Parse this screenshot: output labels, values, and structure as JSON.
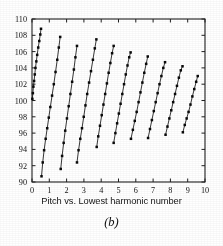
{
  "figure": {
    "caption": "Pitch vs. Lowest harmonic number",
    "subcaption": "(b)"
  },
  "colors": {
    "axis": "#262626",
    "line": "#1a1a1a",
    "marker": "#111111",
    "background": "#ffffff"
  },
  "chart_data": {
    "type": "line",
    "title": "Pitch vs. Lowest harmonic number",
    "xlabel": "Lowest harmonic number",
    "ylabel": "Pitch",
    "xlim": [
      0,
      10
    ],
    "ylim": [
      90,
      110
    ],
    "xticks": [
      0,
      1,
      2,
      3,
      4,
      5,
      6,
      7,
      8,
      9,
      10
    ],
    "yticks": [
      90,
      92,
      94,
      96,
      98,
      100,
      102,
      104,
      106,
      108,
      110
    ],
    "grid": false,
    "legend": false,
    "marker": "square",
    "series": [
      {
        "name": "run-1",
        "x": [
          0.02,
          0.05,
          0.08,
          0.12,
          0.16,
          0.2,
          0.25,
          0.3,
          0.36,
          0.42,
          0.48,
          0.52
        ],
        "y": [
          100.2,
          100.9,
          101.7,
          102.4,
          103.2,
          104.0,
          104.8,
          105.6,
          106.5,
          107.3,
          108.1,
          108.8
        ]
      },
      {
        "name": "run-2",
        "x": [
          0.55,
          0.62,
          0.7,
          0.79,
          0.88,
          0.97,
          1.06,
          1.16,
          1.26,
          1.36,
          1.46,
          1.55,
          1.63
        ],
        "y": [
          90.7,
          92.4,
          93.9,
          95.3,
          96.6,
          97.9,
          99.2,
          100.6,
          102.0,
          103.5,
          105.0,
          106.5,
          107.8
        ]
      },
      {
        "name": "run-3",
        "x": [
          1.66,
          1.74,
          1.83,
          1.92,
          2.02,
          2.12,
          2.22,
          2.32,
          2.42,
          2.51,
          2.6
        ],
        "y": [
          91.6,
          93.2,
          94.8,
          96.3,
          97.8,
          99.3,
          100.8,
          102.3,
          103.8,
          105.3,
          106.7
        ]
      },
      {
        "name": "run-4",
        "x": [
          2.6,
          2.69,
          2.79,
          2.89,
          2.99,
          3.09,
          3.19,
          3.3,
          3.41,
          3.52,
          3.63,
          3.72
        ],
        "y": [
          92.4,
          93.9,
          95.3,
          96.6,
          98.0,
          99.4,
          100.8,
          102.2,
          103.6,
          105.0,
          106.4,
          107.5
        ]
      },
      {
        "name": "run-5",
        "x": [
          3.74,
          3.83,
          3.93,
          4.03,
          4.13,
          4.23,
          4.33,
          4.43,
          4.53,
          4.63,
          4.72
        ],
        "y": [
          94.3,
          95.6,
          96.9,
          98.2,
          99.5,
          100.8,
          102.1,
          103.4,
          104.6,
          105.8,
          106.7
        ]
      },
      {
        "name": "run-6",
        "x": [
          4.72,
          4.82,
          4.92,
          5.02,
          5.12,
          5.22,
          5.32,
          5.42,
          5.52,
          5.62,
          5.7
        ],
        "y": [
          94.8,
          96.0,
          97.2,
          98.4,
          99.6,
          100.8,
          102.0,
          103.2,
          104.3,
          105.3,
          105.9
        ]
      },
      {
        "name": "run-7",
        "x": [
          5.72,
          5.83,
          5.94,
          6.05,
          6.16,
          6.27,
          6.38,
          6.49,
          6.6,
          6.69
        ],
        "y": [
          95.3,
          96.4,
          97.5,
          98.6,
          99.8,
          101.0,
          102.2,
          103.4,
          104.5,
          105.4
        ]
      },
      {
        "name": "run-8",
        "x": [
          6.71,
          6.82,
          6.93,
          7.04,
          7.15,
          7.26,
          7.37,
          7.48,
          7.59,
          7.69
        ],
        "y": [
          95.4,
          96.5,
          97.6,
          98.7,
          99.8,
          100.9,
          102.0,
          103.0,
          104.0,
          104.7
        ]
      },
      {
        "name": "run-9",
        "x": [
          7.72,
          7.83,
          7.94,
          8.05,
          8.16,
          8.27,
          8.38,
          8.49,
          8.6,
          8.7
        ],
        "y": [
          95.8,
          96.8,
          97.8,
          98.8,
          99.8,
          100.8,
          101.8,
          102.8,
          103.7,
          104.2
        ]
      },
      {
        "name": "run-10",
        "x": [
          8.72,
          8.83,
          8.94,
          9.05,
          9.16,
          9.27,
          9.38,
          9.49,
          9.58
        ],
        "y": [
          96.1,
          97.0,
          97.8,
          98.6,
          99.5,
          100.5,
          101.4,
          102.3,
          103.0
        ]
      }
    ]
  }
}
